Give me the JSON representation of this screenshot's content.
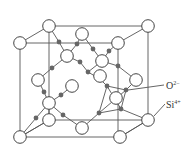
{
  "figure": {
    "labels": [
      {
        "id": "oxygen",
        "text": "O",
        "superscript": "2−",
        "x": 166,
        "y": 88,
        "pointer_from": [
          165,
          85
        ],
        "pointer_to": [
          128,
          90
        ]
      },
      {
        "id": "silicon",
        "text": "Si",
        "superscript": "4+",
        "x": 166,
        "y": 107,
        "pointer_from": [
          165,
          104
        ],
        "pointer_to": [
          154,
          116
        ]
      }
    ],
    "legend": {
      "open_circle": "O2− (large open circle)",
      "filled_dot": "Si4+ (small filled dot)"
    },
    "colors": {
      "line": "#555555",
      "oxygen_fill": "#ffffff",
      "silicon_fill": "#666666",
      "text": "#333333"
    }
  }
}
